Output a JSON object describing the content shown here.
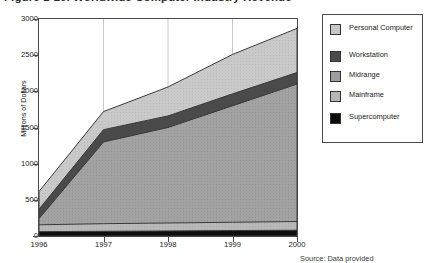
{
  "title": "Figure 1-10. Worldwide Computer Industry Revenue",
  "source_note": "Source: Data provided",
  "axes": {
    "ylabel": "Millions of Dollars",
    "y_ticks": [
      0,
      500,
      1000,
      1500,
      2000,
      2500,
      3000
    ],
    "x_ticks": [
      "1996",
      "1997",
      "1998",
      "1999",
      "2000"
    ]
  },
  "legend": {
    "items": [
      {
        "label": "Personal Computer",
        "color": "#c6c6c6"
      },
      {
        "label": "Workstation",
        "color": "#4a4a4a"
      },
      {
        "label": "Midrange",
        "color": "#9e9e9e"
      },
      {
        "label": "Mainframe",
        "color": "#b5b5b5"
      },
      {
        "label": "Supercomputer",
        "color": "#0d0d0d"
      }
    ]
  },
  "chart_data": {
    "type": "area",
    "title": "Figure 1-10. Worldwide Computer Industry Revenue",
    "xlabel": "",
    "ylabel": "Millions of Dollars",
    "ylim": [
      0,
      3000
    ],
    "grid": true,
    "legend_position": "right",
    "stacked": true,
    "categories": [
      "1996",
      "1997",
      "1998",
      "1999",
      "2000"
    ],
    "series": [
      {
        "name": "Supercomputer",
        "values": [
          60,
          65,
          70,
          75,
          80
        ]
      },
      {
        "name": "Mainframe",
        "values": [
          95,
          105,
          110,
          115,
          120
        ]
      },
      {
        "name": "Midrange",
        "values": [
          85,
          1130,
          1320,
          1610,
          1900
        ]
      },
      {
        "name": "Workstation",
        "values": [
          130,
          170,
          160,
          165,
          160
        ]
      },
      {
        "name": "Personal Computer",
        "values": [
          245,
          250,
          400,
          545,
          610
        ]
      }
    ],
    "cumulative_tops": {
      "Supercomputer": [
        60,
        65,
        70,
        75,
        80
      ],
      "Mainframe": [
        155,
        170,
        180,
        190,
        200
      ],
      "Midrange": [
        240,
        1300,
        1500,
        1800,
        2100
      ],
      "Workstation": [
        370,
        1470,
        1660,
        1965,
        2260
      ],
      "Personal Computer": [
        615,
        1720,
        2060,
        2510,
        2870
      ]
    }
  }
}
